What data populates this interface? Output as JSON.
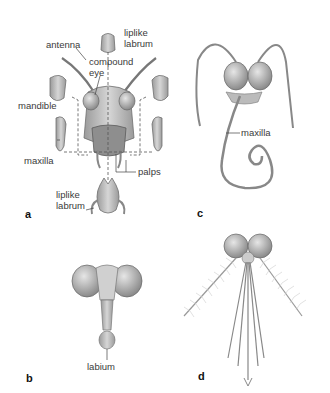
{
  "figure": {
    "panels": [
      {
        "id": "a",
        "label": "a",
        "subject": "grasshopper-chewing-mouthparts",
        "labels": [
          "antenna",
          "liplike labrum",
          "compound eye",
          "mandible",
          "maxilla",
          "palps",
          "liplike labrum"
        ]
      },
      {
        "id": "b",
        "label": "b",
        "subject": "fly-sponging-mouthparts",
        "labels": [
          "labium"
        ]
      },
      {
        "id": "c",
        "label": "c",
        "subject": "butterfly-siphoning-proboscis",
        "labels": [
          "maxilla"
        ]
      },
      {
        "id": "d",
        "label": "d",
        "subject": "mosquito-piercing-sucking-mouthparts",
        "labels": []
      }
    ],
    "text": {
      "antenna": "antenna",
      "labrum_top_1": "liplike",
      "labrum_top_2": "labrum",
      "compound_1": "compound",
      "compound_2": "eye",
      "mandible": "mandible",
      "maxilla_a": "maxilla",
      "palps": "palps",
      "labrum_bot_1": "liplike",
      "labrum_bot_2": "labrum",
      "labium": "labium",
      "maxilla_c": "maxilla",
      "panel_a": "a",
      "panel_b": "b",
      "panel_c": "c",
      "panel_d": "d"
    },
    "colors": {
      "background": "#ffffff",
      "structure_fill": "#c8c8c8",
      "structure_stroke": "#6e6e6e",
      "leader_line": "#444444"
    }
  }
}
